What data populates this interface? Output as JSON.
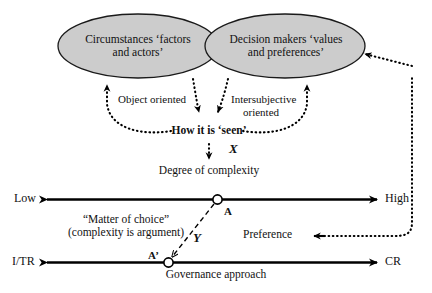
{
  "figure": {
    "type": "conceptual-flow-diagram",
    "background": "#ffffff",
    "ellipse_fill": "#cccccc",
    "stroke": "#000000"
  },
  "nodes": {
    "circumstances": {
      "line1": "Circumstances ‘factors",
      "line2": "and actors’"
    },
    "decision_makers": {
      "line1": "Decision makers ‘values",
      "line2": "and preferences’"
    },
    "object_oriented": "Object oriented",
    "intersubjective_line1": "Intersubjective",
    "intersubjective_line2": "oriented",
    "how_it_is_seen": "How it is ‘seen’",
    "degree_of_complexity": "Degree of complexity",
    "matter_of_choice_line1": "“Matter of choice”",
    "matter_of_choice_line2": "(complexity is argument)",
    "preference": "Preference",
    "governance_approach": "Governance approach"
  },
  "variables": {
    "x": "X",
    "y": "Y",
    "point_a": "A",
    "point_a_prime": "A’"
  },
  "axes": {
    "complexity": {
      "name": "Degree of complexity",
      "left_label": "Low",
      "right_label": "High",
      "marker": "A"
    },
    "governance": {
      "name": "Governance approach",
      "left_label": "I/TR",
      "right_label": "CR",
      "marker": "A’"
    }
  }
}
